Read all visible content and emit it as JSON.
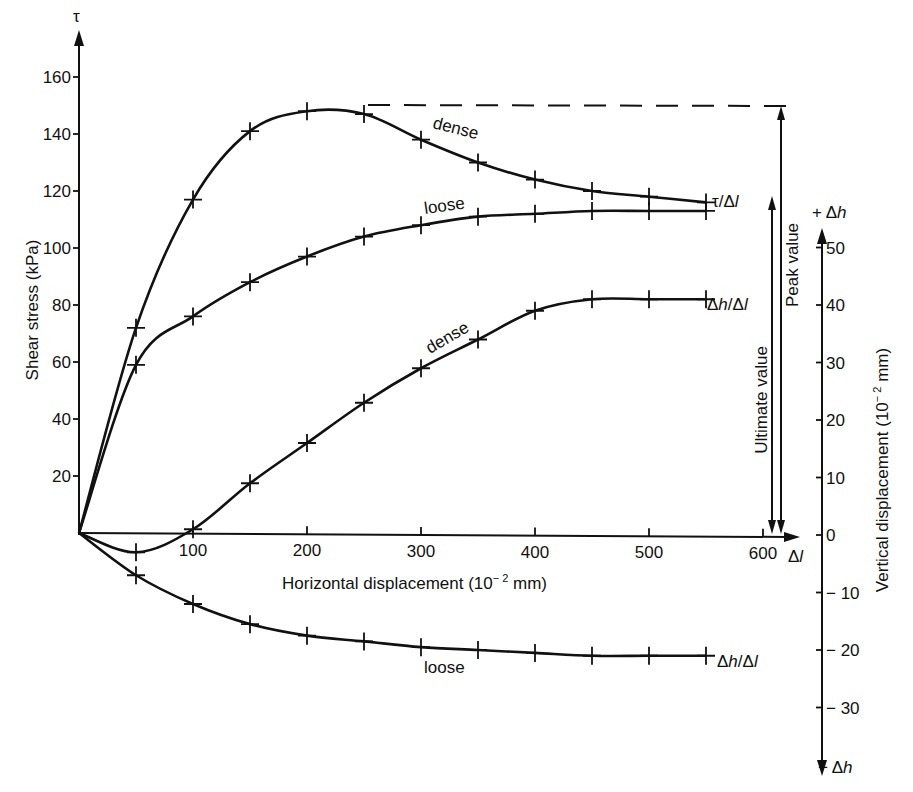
{
  "chart_data": {
    "type": "line",
    "title": "",
    "xlabel": "Horizontal displacement (10⁻² mm)",
    "ylabel_left": "Shear stress (kPa)",
    "ylabel_right": "Vertical displacement (10⁻² mm)",
    "x_axis_symbol": "Δl",
    "y_axis_left_symbol": "τ",
    "y_axis_right_top_symbol": "+Δh",
    "y_axis_right_bottom_symbol": "−Δh",
    "x_ticks": [
      100,
      200,
      300,
      400,
      500,
      600
    ],
    "y_left_ticks": [
      20,
      40,
      60,
      80,
      100,
      120,
      140,
      160
    ],
    "y_right_ticks": [
      50,
      40,
      30,
      20,
      10,
      0,
      -10,
      -20,
      -30
    ],
    "xlim": [
      0,
      630
    ],
    "ylim_left": [
      0,
      170
    ],
    "ylim_right": [
      -35,
      55
    ],
    "x": [
      0,
      50,
      100,
      150,
      200,
      250,
      300,
      350,
      400,
      450,
      500,
      550
    ],
    "series": [
      {
        "name": "dense τ/Δl",
        "axis": "left",
        "values": [
          0,
          72,
          117,
          141,
          148,
          147,
          138,
          130,
          124,
          120,
          118,
          116
        ]
      },
      {
        "name": "loose τ/Δl",
        "axis": "left",
        "values": [
          0,
          59,
          76,
          88,
          97,
          104,
          108,
          111,
          112,
          113,
          113,
          113
        ]
      },
      {
        "name": "dense Δh/Δl",
        "axis": "right",
        "values": [
          0,
          -3,
          1,
          9,
          16,
          23,
          29,
          34,
          39,
          41,
          41,
          41
        ]
      },
      {
        "name": "loose Δh/Δl",
        "axis": "right",
        "values": [
          0,
          -7,
          -12,
          -15.5,
          -17.5,
          -18.5,
          -19.5,
          -20,
          -20.5,
          -21,
          -21,
          -21
        ]
      }
    ],
    "annotations": [
      {
        "text": "dense",
        "near": "dense τ/Δl"
      },
      {
        "text": "loose",
        "near": "loose τ/Δl"
      },
      {
        "text": "dense",
        "near": "dense Δh/Δl"
      },
      {
        "text": "loose",
        "near": "loose Δh/Δl"
      },
      {
        "text": "τ/Δl",
        "at_end_of": "shear curves"
      },
      {
        "text": "Δh/Δl",
        "at_end_of": "dense Δh/Δl"
      },
      {
        "text": "Δh/Δl",
        "at_end_of": "loose Δh/Δl"
      },
      {
        "text": "Peak value",
        "value": 148
      },
      {
        "text": "Ultimate value",
        "value": 116
      }
    ],
    "peak_value": 148,
    "ultimate_value": 116,
    "grid": false,
    "legend": "none (inline labels)"
  },
  "labels": {
    "tau": "τ",
    "y_left_title": "Shear stress (kPa)",
    "x_title": "Horizontal displacement (10",
    "x_title_sup": "− 2",
    "x_title_end": " mm)",
    "y_right_title": "Vertical displacement (10",
    "y_right_title_sup": "− 2",
    "y_right_title_end": " mm)",
    "delta_l": "Δ",
    "delta_l_l": "l",
    "plus_dh": "+ Δ",
    "minus_dh": "− Δ",
    "h": "h",
    "dense": "dense",
    "loose": "loose",
    "tau_dl_a": "τ/Δ",
    "dh_dl_a": "Δ",
    "dh_dl_b": "/Δ",
    "l": "l",
    "peak": "Peak value",
    "ultimate": "Ultimate value",
    "xt": [
      "100",
      "200",
      "300",
      "400",
      "500",
      "600"
    ],
    "ylt": [
      "20",
      "40",
      "60",
      "80",
      "100",
      "120",
      "140",
      "160"
    ],
    "yrt": [
      "50",
      "40",
      "30",
      "20",
      "10",
      "0",
      "− 10",
      "− 20",
      "− 30"
    ]
  }
}
